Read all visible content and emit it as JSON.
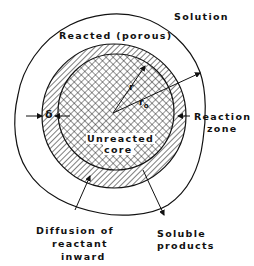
{
  "diagram": {
    "type": "shrinking-core particle schematic",
    "labels": {
      "solution": "Solution",
      "reacted": "Reacted (porous)",
      "reaction_zone_line1": "Reaction",
      "reaction_zone_line2": "zone",
      "core_line1": "Unreacted",
      "core_line2": "core",
      "diffusion_line1": "Diffusion of",
      "diffusion_line2": "reactant",
      "diffusion_line3": "inward",
      "soluble_line1": "Soluble",
      "soluble_line2": "products",
      "delta": "δ",
      "r": "r",
      "r0": "r",
      "r0_sub": "o"
    },
    "regions": [
      {
        "name": "solution",
        "fill": "none"
      },
      {
        "name": "reacted-porous-shell",
        "fill": "none"
      },
      {
        "name": "reaction-zone",
        "fill": "diagonal-hatch"
      },
      {
        "name": "unreacted-core",
        "fill": "cross-hatch"
      }
    ],
    "colors": {
      "ink": "#111111",
      "background": "#ffffff"
    }
  }
}
